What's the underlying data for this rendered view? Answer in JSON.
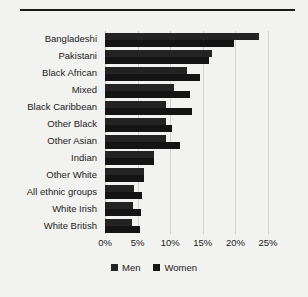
{
  "chart_data": {
    "type": "bar",
    "orientation": "horizontal",
    "title": "",
    "subtitle": "",
    "xlabel": "",
    "ylabel": "",
    "xlim": [
      0,
      25
    ],
    "xticks": [
      0,
      5,
      10,
      15,
      20,
      25
    ],
    "xtick_labels": [
      "0%",
      "5%",
      "10%",
      "15%",
      "20%",
      "25%"
    ],
    "grid": true,
    "grid_axis": "x",
    "legend_position": "bottom",
    "categories": [
      "Bangladeshi",
      "Pakistani",
      "Black African",
      "Mixed",
      "Black Caribbean",
      "Other Black",
      "Other Asian",
      "Indian",
      "Other White",
      "All ethnic groups",
      "White Irish",
      "White British"
    ],
    "series": [
      {
        "name": "Men",
        "color": "#232323",
        "values": [
          23.6,
          16.4,
          12.5,
          10.6,
          9.4,
          9.4,
          9.3,
          7.5,
          6.0,
          4.5,
          4.3,
          4.1
        ]
      },
      {
        "name": "Women",
        "color": "#141414",
        "values": [
          19.8,
          15.9,
          14.6,
          13.0,
          13.4,
          10.2,
          11.5,
          7.5,
          6.0,
          5.6,
          5.5,
          5.3
        ]
      }
    ]
  },
  "legend": {
    "entries": [
      {
        "label": "Men",
        "color": "#232323"
      },
      {
        "label": "Women",
        "color": "#141414"
      }
    ]
  }
}
